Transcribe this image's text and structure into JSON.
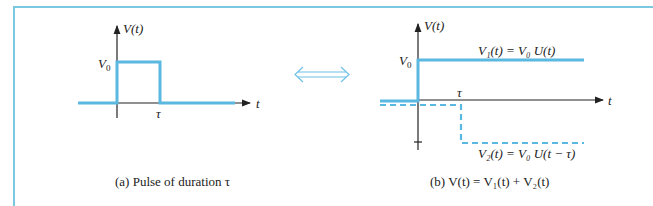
{
  "colors": {
    "signal": "#5bb8e0",
    "frame": "#7cc8e0",
    "axis": "#222222",
    "arrow": "#6ec0e6"
  },
  "panel_a": {
    "y_axis_label": "V(t)",
    "x_axis_label": "t",
    "level_label": "V",
    "level_sub": "0",
    "tau_label": "τ",
    "caption": "(a)  Pulse of duration τ"
  },
  "equivalence_icon": "double-headed-arrow-icon",
  "panel_b": {
    "y_axis_label": "V(t)",
    "x_axis_label": "t",
    "level_label": "V",
    "level_sub": "0",
    "tau_label": "τ",
    "v1_label": "V₁(t) = V₀ U(t)",
    "v2_label": "V₂(t) = V₀ U(t − τ)",
    "caption": "(b)  V(t) = V₁(t) + V₂(t)"
  }
}
